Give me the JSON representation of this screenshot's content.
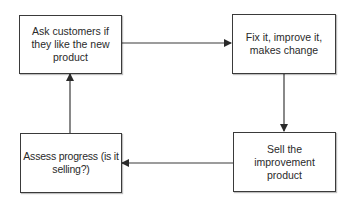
{
  "diagram": {
    "type": "cycle-flowchart",
    "nodes": [
      {
        "id": "ask",
        "label": "Ask customers if they like the new product"
      },
      {
        "id": "fix",
        "label": "Fix it, improve it, makes change"
      },
      {
        "id": "sell",
        "label": "Sell the improvement product"
      },
      {
        "id": "assess",
        "label": "Assess progress (is it selling?)"
      }
    ],
    "edges": [
      {
        "from": "ask",
        "to": "fix"
      },
      {
        "from": "fix",
        "to": "sell"
      },
      {
        "from": "sell",
        "to": "assess"
      },
      {
        "from": "assess",
        "to": "ask"
      }
    ],
    "colors": {
      "stroke": "#3a3a3a",
      "background": "#ffffff",
      "text": "#2a2a2a"
    }
  }
}
